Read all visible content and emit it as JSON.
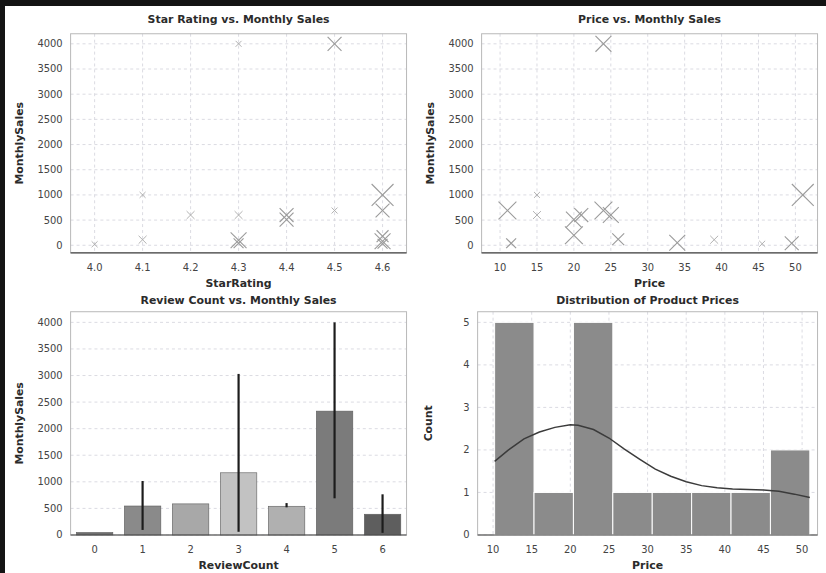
{
  "figure": {
    "background": "#ffffff",
    "frame_color": "#141414",
    "panels": 4
  },
  "chart_data": [
    {
      "id": "star-rating-vs-monthly-sales",
      "type": "scatter",
      "title": "Star Rating vs. Monthly Sales",
      "xlabel": "StarRating",
      "ylabel": "MonthlySales",
      "xlim": [
        3.95,
        4.65
      ],
      "ylim": [
        -150,
        4200
      ],
      "xticks": [
        "4.0",
        "4.1",
        "4.2",
        "4.3",
        "4.4",
        "4.5",
        "4.6"
      ],
      "xtickvals": [
        4.0,
        4.1,
        4.2,
        4.3,
        4.4,
        4.5,
        4.6
      ],
      "yticks": [
        "0",
        "500",
        "1000",
        "1500",
        "2000",
        "2500",
        "3000",
        "3500",
        "4000"
      ],
      "ytickvals": [
        0,
        500,
        1000,
        1500,
        2000,
        2500,
        3000,
        3500,
        4000
      ],
      "grid": true,
      "marker": "x",
      "marker_color": "#9a9a9a",
      "points": [
        {
          "x": 4.3,
          "y": 4000,
          "size": 3
        },
        {
          "x": 4.5,
          "y": 4000,
          "size": 7
        },
        {
          "x": 4.1,
          "y": 1000,
          "size": 3
        },
        {
          "x": 4.6,
          "y": 1000,
          "size": 11
        },
        {
          "x": 4.2,
          "y": 600,
          "size": 4
        },
        {
          "x": 4.3,
          "y": 600,
          "size": 4
        },
        {
          "x": 4.4,
          "y": 600,
          "size": 7
        },
        {
          "x": 4.4,
          "y": 510,
          "size": 7
        },
        {
          "x": 4.5,
          "y": 690,
          "size": 3
        },
        {
          "x": 4.6,
          "y": 690,
          "size": 7
        },
        {
          "x": 4.1,
          "y": 110,
          "size": 4
        },
        {
          "x": 4.3,
          "y": 100,
          "size": 8
        },
        {
          "x": 4.3,
          "y": 40,
          "size": 5
        },
        {
          "x": 4.6,
          "y": 180,
          "size": 6
        },
        {
          "x": 4.6,
          "y": 80,
          "size": 8
        },
        {
          "x": 4.6,
          "y": 30,
          "size": 5
        },
        {
          "x": 4.0,
          "y": 20,
          "size": 3
        }
      ]
    },
    {
      "id": "price-vs-monthly-sales",
      "type": "scatter",
      "title": "Price vs. Monthly Sales",
      "xlabel": "Price",
      "ylabel": "MonthlySales",
      "xlim": [
        7.5,
        53
      ],
      "ylim": [
        -150,
        4200
      ],
      "xticks": [
        "10",
        "15",
        "20",
        "25",
        "30",
        "35",
        "40",
        "45",
        "50"
      ],
      "xtickvals": [
        10,
        15,
        20,
        25,
        30,
        35,
        40,
        45,
        50
      ],
      "yticks": [
        "0",
        "500",
        "1000",
        "1500",
        "2000",
        "2500",
        "3000",
        "3500",
        "4000"
      ],
      "ytickvals": [
        0,
        500,
        1000,
        1500,
        2000,
        2500,
        3000,
        3500,
        4000
      ],
      "grid": true,
      "marker": "x",
      "marker_color": "#9a9a9a",
      "points": [
        {
          "x": 24,
          "y": 4000,
          "size": 8
        },
        {
          "x": 15,
          "y": 1000,
          "size": 3
        },
        {
          "x": 51,
          "y": 1000,
          "size": 11
        },
        {
          "x": 11,
          "y": 690,
          "size": 9
        },
        {
          "x": 15,
          "y": 600,
          "size": 4
        },
        {
          "x": 24,
          "y": 690,
          "size": 9
        },
        {
          "x": 25,
          "y": 600,
          "size": 8
        },
        {
          "x": 21,
          "y": 600,
          "size": 7
        },
        {
          "x": 20,
          "y": 510,
          "size": 8
        },
        {
          "x": 20,
          "y": 200,
          "size": 9
        },
        {
          "x": 26,
          "y": 120,
          "size": 6
        },
        {
          "x": 11.5,
          "y": 40,
          "size": 5
        },
        {
          "x": 34,
          "y": 50,
          "size": 8
        },
        {
          "x": 39,
          "y": 110,
          "size": 4
        },
        {
          "x": 45.5,
          "y": 30,
          "size": 3
        },
        {
          "x": 49.5,
          "y": 40,
          "size": 7
        }
      ]
    },
    {
      "id": "review-count-vs-monthly-sales",
      "type": "bar",
      "title": "Review Count vs. Monthly Sales",
      "xlabel": "ReviewCount",
      "ylabel": "MonthlySales",
      "ylim": [
        0,
        4200
      ],
      "categories": [
        "0",
        "1",
        "2",
        "3",
        "4",
        "5",
        "6"
      ],
      "values": [
        30,
        545,
        585,
        1170,
        540,
        2330,
        390
      ],
      "yticks": [
        "0",
        "500",
        "1000",
        "1500",
        "2000",
        "2500",
        "3000",
        "3500",
        "4000"
      ],
      "ytickvals": [
        0,
        500,
        1000,
        1500,
        2000,
        2500,
        3000,
        3500,
        4000
      ],
      "grid": true,
      "error_bars": [
        {
          "category": "0",
          "low": null,
          "high": null
        },
        {
          "category": "1",
          "low": 95,
          "high": 1015
        },
        {
          "category": "2",
          "low": null,
          "high": null
        },
        {
          "category": "3",
          "low": 60,
          "high": 3030
        },
        {
          "category": "4",
          "low": 520,
          "high": 600
        },
        {
          "category": "5",
          "low": 690,
          "high": 4000
        },
        {
          "category": "6",
          "low": 40,
          "high": 765
        }
      ],
      "bar_colors": [
        "#6f6f6f",
        "#8a8a8a",
        "#a8a8a8",
        "#c2c2c2",
        "#b0b0b0",
        "#7b7b7b",
        "#5e5e5e"
      ],
      "error_bar_color": "#1c1c1c"
    },
    {
      "id": "distribution-of-product-prices",
      "type": "bar",
      "title": "Distribution of Product Prices",
      "xlabel": "Price",
      "ylabel": "Count",
      "xlim": [
        8,
        52
      ],
      "ylim": [
        0,
        5.25
      ],
      "xticks": [
        "10",
        "15",
        "20",
        "25",
        "30",
        "35",
        "40",
        "45",
        "50"
      ],
      "xtickvals": [
        10,
        15,
        20,
        25,
        30,
        35,
        40,
        45,
        50
      ],
      "yticks": [
        "0",
        "1",
        "2",
        "3",
        "4",
        "5"
      ],
      "ytickvals": [
        0,
        1,
        2,
        3,
        4,
        5
      ],
      "grid": true,
      "bin_edges": [
        10.2,
        15.3,
        20.4,
        25.5,
        30.6,
        35.7,
        40.8,
        45.9,
        51.0
      ],
      "counts": [
        5,
        1,
        5,
        1,
        1,
        1,
        1,
        2
      ],
      "bar_color": "#8b8b8b",
      "kde": {
        "color": "#3b3b3b",
        "x": [
          10.2,
          12,
          14,
          16,
          18,
          20,
          21,
          23,
          25,
          27,
          29,
          31,
          33,
          35,
          37,
          39,
          41,
          43,
          45,
          47,
          49,
          51
        ],
        "y": [
          1.73,
          2.0,
          2.26,
          2.42,
          2.53,
          2.59,
          2.58,
          2.48,
          2.28,
          2.02,
          1.78,
          1.55,
          1.38,
          1.25,
          1.16,
          1.11,
          1.08,
          1.07,
          1.06,
          1.03,
          0.96,
          0.88
        ]
      }
    }
  ]
}
